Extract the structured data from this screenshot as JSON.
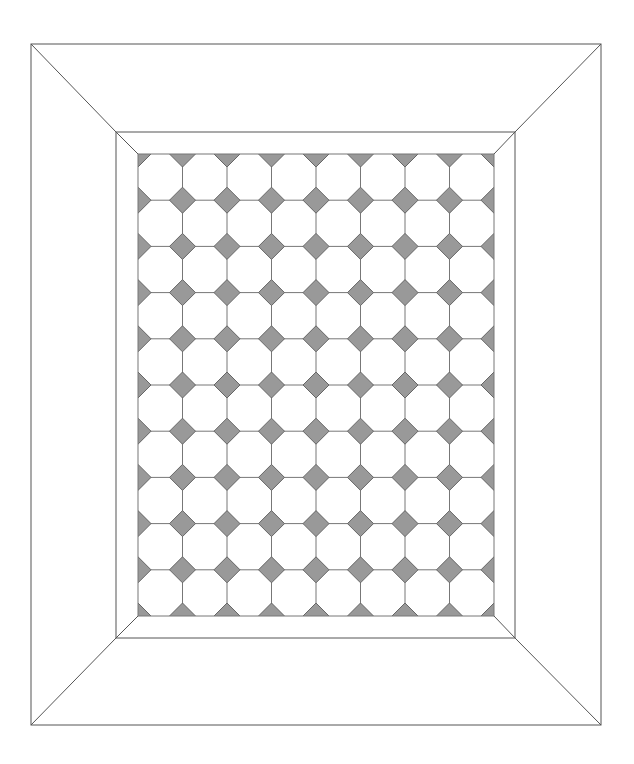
{
  "diagram": {
    "canvas": {
      "width": 634,
      "height": 764,
      "background": "#ffffff"
    },
    "outer_frame": {
      "x1": 31,
      "y1": 44,
      "x2": 601,
      "y2": 725
    },
    "inner_frame": {
      "x1": 116,
      "y1": 132,
      "x2": 515,
      "y2": 638
    },
    "tile_field": {
      "x1": 138,
      "y1": 154,
      "x2": 494,
      "y2": 616,
      "columns": 8,
      "rows": 10
    },
    "tile": {
      "shape": "octagon",
      "fill": "#ffffff",
      "dot_shape": "diamond",
      "dot_fill": "#999999",
      "dot_half_size": 13
    },
    "colors": {
      "line": "#555555",
      "tile_line": "#777777",
      "dot_fill": "#999999",
      "dot_stroke": "#666666"
    }
  }
}
